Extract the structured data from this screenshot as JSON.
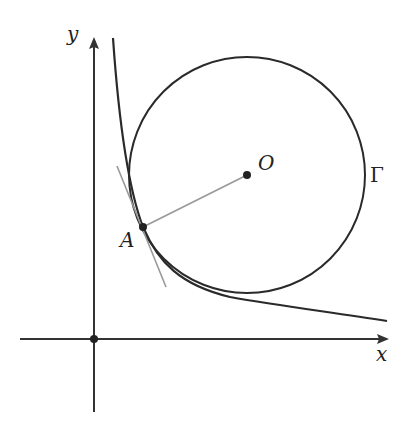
{
  "diagram": {
    "axes": {
      "x_label": "x",
      "y_label": "y",
      "origin_marked": true
    },
    "points": {
      "O": {
        "label": "O",
        "role": "circle center"
      },
      "A": {
        "label": "A",
        "role": "tangency point"
      }
    },
    "circle": {
      "label": "Γ"
    },
    "colors": {
      "curve": "#2a2a2a",
      "axis": "#333333",
      "radius_segment": "#999999",
      "tangent_line": "#999999",
      "point": "#222222"
    }
  }
}
